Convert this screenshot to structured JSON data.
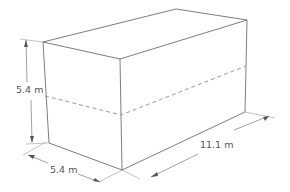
{
  "diagram": {
    "type": "rectangular-prism",
    "dimensions": {
      "height": "5.4 m",
      "width": "5.4 m",
      "length": "11.1 m"
    },
    "hidden_line": "dashed mid-height line on front and right faces",
    "colors": {
      "edge": "#6e6e6e",
      "label": "#555555",
      "dash": "#9a9a9a"
    }
  }
}
